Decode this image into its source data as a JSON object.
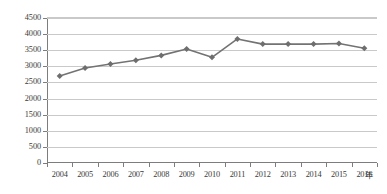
{
  "chart_data": {
    "type": "line",
    "title": "",
    "xlabel": "年",
    "ylabel": "",
    "categories": [
      "2004",
      "2005",
      "2006",
      "2007",
      "2008",
      "2009",
      "2010",
      "2011",
      "2012",
      "2013",
      "2014",
      "2015",
      "2016"
    ],
    "values": [
      2700,
      2950,
      3070,
      3190,
      3340,
      3540,
      3280,
      3850,
      3690,
      3690,
      3690,
      3710,
      3560
    ],
    "series": [
      {
        "name": "",
        "values": [
          2700,
          2950,
          3070,
          3190,
          3340,
          3540,
          3280,
          3850,
          3690,
          3690,
          3690,
          3710,
          3560
        ]
      }
    ],
    "ylim": [
      0,
      4500
    ],
    "yticks": [
      0,
      500,
      1000,
      1500,
      2000,
      2500,
      3000,
      3500,
      4000,
      4500
    ],
    "ytick_labels": [
      "0",
      "500",
      "1000",
      "1500",
      "2000",
      "2500",
      "3000",
      "3500",
      "4000",
      "4500"
    ],
    "grid": true,
    "legend": false,
    "legend_position": "none",
    "marker": "diamond",
    "line_color": "#737373",
    "marker_color": "#6e6e6e",
    "grid_color": "#c9c9c9",
    "axis_color": "#7d7d7d"
  },
  "axis": {
    "x_unit_label": "年"
  }
}
